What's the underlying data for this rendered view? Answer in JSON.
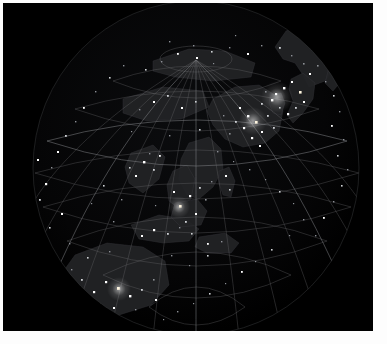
{
  "view": {
    "title": "Earth at Night — Orthographic Globe",
    "background_color": "#000000",
    "page_margin_color": "#fdfdfd",
    "width": 387,
    "height": 344
  },
  "image": {
    "frame": {
      "x": 3,
      "y": 3,
      "width": 370,
      "height": 328
    },
    "alt_text": "Night-lights view of Earth centered on East Asia and the Western Pacific"
  },
  "globe": {
    "center_x": 196,
    "center_y": 168,
    "radius_x": 163,
    "radius_y": 168,
    "limb_color": "#4a4b4e",
    "graticule": {
      "meridian_step_degrees": 15,
      "parallel_step_degrees": 15,
      "line_color": "#6d6f72",
      "major_line_color": "#85878b",
      "pole_visible": "north",
      "pole_screen_x": 192,
      "pole_screen_y": 57
    },
    "land": {
      "fill_color": "#232427",
      "outline_color": "#3a3b3e",
      "regions": [
        "East Asia mainland",
        "Korean Peninsula",
        "Japanese Archipelago",
        "Kamchatka / Russian Far East",
        "Southeast Asia",
        "Indonesian Archipelago",
        "Australia",
        "Philippines"
      ]
    },
    "lights": {
      "bright_color": "#ffffff",
      "dim_color": "#cfd2d6",
      "faint_color": "#8d9096",
      "warm_color": "#fff6e0",
      "clusters": [
        {
          "name": "Japan-Korea corridor",
          "x": 276,
          "y": 96,
          "intensity": "bright"
        },
        {
          "name": "Eastern China seaboard",
          "x": 252,
          "y": 120,
          "intensity": "bright"
        },
        {
          "name": "Southeast Asia",
          "x": 178,
          "y": 206,
          "intensity": "dim"
        },
        {
          "name": "Australia east coast",
          "x": 118,
          "y": 288,
          "intensity": "bright"
        },
        {
          "name": "Indonesian Islands",
          "x": 150,
          "y": 268,
          "intensity": "dim"
        },
        {
          "name": "Siberian interior",
          "x": 300,
          "y": 72,
          "intensity": "faint"
        },
        {
          "name": "Western limb scatter",
          "x": 40,
          "y": 182,
          "intensity": "faint"
        }
      ],
      "point_count": 212
    }
  },
  "chart_data": {
    "type": "scatter",
    "projection": "orthographic",
    "center_lon": 130,
    "center_lat": 20,
    "xlabel": "Longitude",
    "ylabel": "Latitude",
    "xlim": [
      -180,
      180
    ],
    "ylim": [
      -90,
      90
    ],
    "grid": true,
    "legend": "none",
    "series": [
      {
        "name": "City lights",
        "marker": "square",
        "color": "#ffffff",
        "description": "Nighttime radiance points over land"
      },
      {
        "name": "Graticule",
        "marker": "line",
        "color": "#6d6f72",
        "description": "15-degree latitude and longitude grid"
      },
      {
        "name": "Landmass",
        "marker": "polygon",
        "color": "#232427",
        "description": "Continental outlines"
      }
    ]
  }
}
